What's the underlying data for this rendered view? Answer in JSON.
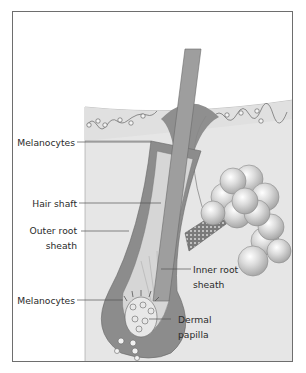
{
  "figure": {
    "labels_left": [
      {
        "id": "melanocytes-top",
        "text": "Melanocytes"
      },
      {
        "id": "hair-shaft",
        "text": "Hair shaft"
      },
      {
        "id": "outer-root-sheath",
        "line1": "Outer root",
        "line2": "sheath"
      },
      {
        "id": "melanocytes-bottom",
        "text": "Melanocytes"
      }
    ],
    "labels_right": [
      {
        "id": "inner-root-sheath",
        "line1": "Inner root",
        "line2": "sheath"
      },
      {
        "id": "dermal-papilla",
        "line1": "Dermal",
        "line2": "papilla"
      }
    ],
    "colors": {
      "frame": "#6e6e6e",
      "skin": "#e6e6e6",
      "epidermis_edge": "#d4d4d4",
      "hair_shaft": "#9a9a9a",
      "outer_sheath": "#8c8c8c",
      "sebaceous_gland": "#cfcfcf",
      "leader_line": "#555555"
    }
  }
}
